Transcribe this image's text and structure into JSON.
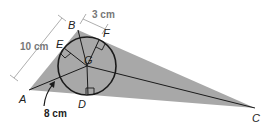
{
  "diagram": {
    "type": "triangle-incircle",
    "colors": {
      "triangle_fill": "#a8a8a8",
      "line": "#1a1a1a",
      "measure_line": "#999999",
      "measure_text": "#777777",
      "label_text": "#222222"
    },
    "vertices": {
      "A": {
        "label": "A",
        "x": 29,
        "y": 90
      },
      "B": {
        "label": "B",
        "x": 78,
        "y": 30
      },
      "C": {
        "label": "C",
        "x": 255,
        "y": 108
      }
    },
    "incenter": {
      "label": "G",
      "x": 87,
      "y": 66
    },
    "tangent_points": {
      "D": {
        "label": "D"
      },
      "E": {
        "label": "E"
      },
      "F": {
        "label": "F"
      }
    },
    "measurements": {
      "AB": "10 cm",
      "BF": "3 cm",
      "AG_part": "8 cm"
    }
  }
}
